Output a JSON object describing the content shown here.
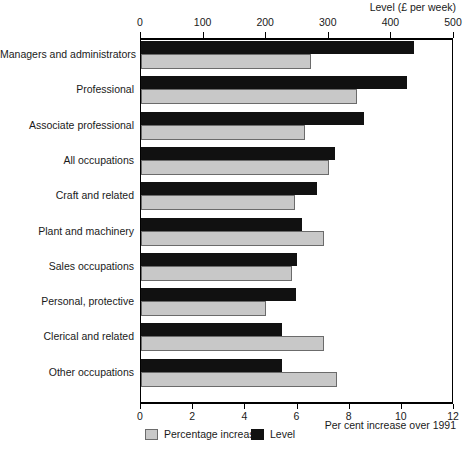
{
  "chart_data": {
    "type": "bar",
    "orientation": "horizontal",
    "title": "",
    "categories": [
      "Managers and administrators",
      "Professional",
      "Associate professional",
      "All occupations",
      "Craft and related",
      "Plant and machinery",
      "Sales occupations",
      "Personal, protective",
      "Clerical and related",
      "Other occupations"
    ],
    "series": [
      {
        "name": "Percentage increase",
        "axis": "bottom",
        "color": "#c8c8c8",
        "values": [
          6.5,
          8.3,
          6.3,
          7.2,
          5.9,
          7.0,
          5.8,
          4.8,
          7.0,
          7.5
        ]
      },
      {
        "name": "Level",
        "axis": "top",
        "color": "#111111",
        "values": [
          436,
          425,
          356,
          310,
          281,
          257,
          249,
          248,
          225,
          225
        ]
      }
    ],
    "top_axis": {
      "label": "Level (£ per week)",
      "ticks": [
        0,
        100,
        200,
        300,
        400,
        500
      ],
      "range": [
        0,
        500
      ]
    },
    "bottom_axis": {
      "label": "Per cent increase over 1991",
      "ticks": [
        0,
        2,
        4,
        6,
        8,
        10,
        12
      ],
      "range": [
        0,
        12
      ]
    },
    "legend": {
      "position": "bottom-center",
      "entries": [
        {
          "label": "Percentage increase",
          "swatch": "grey-square-swatch"
        },
        {
          "label": "Level",
          "swatch": "black-square-swatch"
        }
      ]
    },
    "grid": false
  }
}
